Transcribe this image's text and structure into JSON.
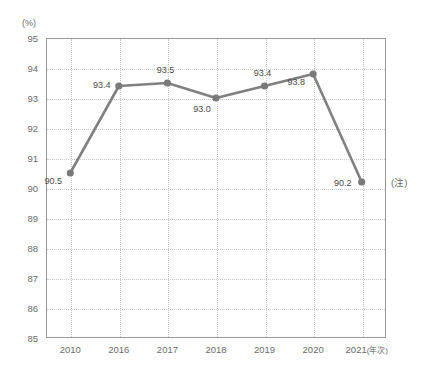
{
  "chart_data": {
    "type": "line",
    "title": "",
    "subtitle": "",
    "xlabel": "年次",
    "ylabel": "(%)",
    "categories": [
      "2010",
      "2016",
      "2017",
      "2018",
      "2019",
      "2020",
      "2021"
    ],
    "values": [
      90.5,
      93.4,
      93.5,
      93.0,
      93.4,
      93.8,
      90.2
    ],
    "point_labels": [
      "90.5",
      "93.4",
      "93.5",
      "93.0",
      "93.4",
      "93.8",
      "90.2"
    ],
    "ylim": [
      85,
      95
    ],
    "y_ticks": [
      "95",
      "94",
      "93",
      "92",
      "91",
      "90",
      "89",
      "88",
      "87",
      "86",
      "85"
    ],
    "grid": true,
    "legend": "none",
    "series": [
      {
        "name": "",
        "values": [
          90.5,
          93.4,
          93.5,
          93.0,
          93.4,
          93.8,
          90.2
        ]
      }
    ],
    "annotations": [
      {
        "text": "(注)",
        "near_value": 90.2,
        "position": "right-of-last-point"
      }
    ],
    "colors": {
      "line": "#808080",
      "marker": "#7a7a7a",
      "grid": "#c9c9c9",
      "axis": "#9a9a9a",
      "text": "#6b6b6b"
    }
  },
  "axis": {
    "y_unit_label": "(%)",
    "x_unit_label": "(年次)"
  },
  "note": {
    "marker": "(注)"
  }
}
